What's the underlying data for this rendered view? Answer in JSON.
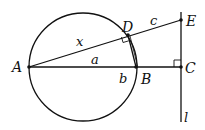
{
  "diagram": {
    "type": "geometry",
    "points": {
      "A": {
        "label": "A",
        "x": 29,
        "y": 67
      },
      "B": {
        "label": "B",
        "x": 136,
        "y": 67
      },
      "C": {
        "label": "C",
        "x": 181,
        "y": 67
      },
      "D": {
        "label": "D",
        "x": 128,
        "y": 35
      },
      "E": {
        "label": "E",
        "x": 181,
        "y": 20
      }
    },
    "circle": {
      "cx": 83,
      "cy": 67,
      "r": 54,
      "diameter": "AB"
    },
    "line_l": {
      "label": "l",
      "x": 181,
      "y1": 12,
      "y2": 122
    },
    "segment_labels": {
      "x": "x",
      "a": "a",
      "b": "b",
      "c": "c"
    },
    "right_angles": [
      "D (ADB)",
      "C (ACE)"
    ],
    "colors": {
      "stroke": "#111111",
      "background": "#ffffff"
    }
  }
}
